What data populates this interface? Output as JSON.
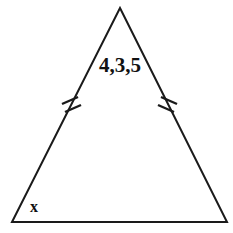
{
  "figure": {
    "kind": "isosceles-triangle-diagram",
    "background_color": "#ffffff",
    "stroke_color": "#1a1a1a",
    "stroke_width": 2,
    "width": 233,
    "height": 233,
    "vertices": {
      "apex": {
        "x": 120,
        "y": 8
      },
      "bottom_left": {
        "x": 12,
        "y": 222
      },
      "bottom_right": {
        "x": 227,
        "y": 222
      }
    },
    "labels": {
      "sides": {
        "text": "4,3,5",
        "x": 99,
        "y": 72,
        "font_size": 21,
        "color": "#111111"
      },
      "angle": {
        "text": "x",
        "x": 30,
        "y": 212,
        "font_size": 16,
        "color": "#111111"
      }
    },
    "tick_marks": {
      "count_per_side": 2,
      "meaning": "congruent-sides",
      "left": [
        {
          "x1": 62,
          "y1": 104,
          "x2": 78,
          "y2": 97
        },
        {
          "x1": 65,
          "y1": 112,
          "x2": 81,
          "y2": 105
        }
      ],
      "right": [
        {
          "x1": 161,
          "y1": 97,
          "x2": 177,
          "y2": 104
        },
        {
          "x1": 158,
          "y1": 105,
          "x2": 174,
          "y2": 112
        }
      ]
    }
  }
}
